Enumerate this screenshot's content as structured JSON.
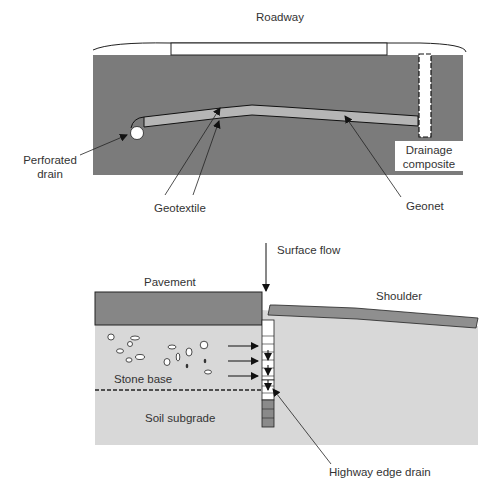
{
  "top_diagram": {
    "labels": {
      "roadway": "Roadway",
      "drainage_composite_line1": "Drainage",
      "drainage_composite_line2": "composite",
      "perforated_drain_line1": "Perforated",
      "perforated_drain_line2": "drain",
      "geotextile": "Geotextile",
      "geonet": "Geonet"
    },
    "colors": {
      "soil": "#7a7a7a",
      "geonet_layer": "#b4b4b4",
      "outline": "#1a1a1a"
    }
  },
  "bottom_diagram": {
    "labels": {
      "surface_flow": "Surface flow",
      "pavement": "Pavement",
      "shoulder": "Shoulder",
      "stone_base": "Stone base",
      "soil_subgrade": "Soil subgrade",
      "highway_edge_drain": "Highway edge drain"
    },
    "colors": {
      "pavement": "#858585",
      "base": "#d9d9d9",
      "shoulder": "#8f8f8f",
      "drain_lower": "#8a8a8a"
    }
  }
}
